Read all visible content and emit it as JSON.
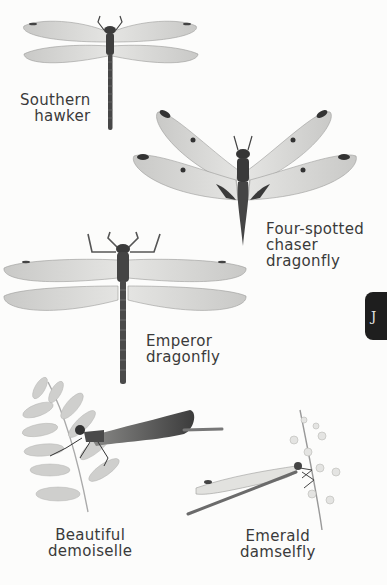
{
  "page": {
    "background": "#fcfcfb",
    "index_tab": {
      "letter": "J",
      "color": "#1e1e1e"
    }
  },
  "species": [
    {
      "id": "southern-hawker",
      "line1": "Southern",
      "line2": "hawker"
    },
    {
      "id": "four-spotted-chaser",
      "line1": "Four-spotted",
      "line2": "chaser",
      "line3": "dragonfly"
    },
    {
      "id": "emperor-dragonfly",
      "line1": "Emperor",
      "line2": "dragonfly"
    },
    {
      "id": "beautiful-demoiselle",
      "line1": "Beautiful",
      "line2": "demoiselle"
    },
    {
      "id": "emerald-damselfly",
      "line1": "Emerald",
      "line2": "damselfly"
    }
  ]
}
